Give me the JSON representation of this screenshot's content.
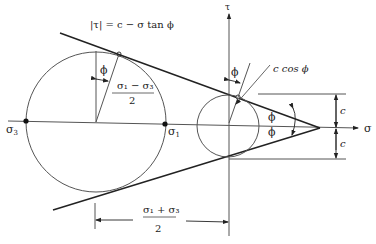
{
  "diagram": {
    "equation": "|τ| = c − σ tan ϕ",
    "axes": {
      "horizontal_label": "σ",
      "vertical_label": "τ"
    },
    "labels": {
      "sigma3": "σ",
      "sigma3_sub": "3",
      "sigma1": "σ",
      "sigma1_sub": "1",
      "phi_top_big": "ϕ",
      "phi_top_small": "ϕ",
      "phi_apex_upper": "ϕ",
      "phi_apex_lower": "ϕ",
      "c_cos_phi": "c cos ϕ",
      "c_upper": "c",
      "c_lower": "c",
      "radius_numerator": "σ₁ − σ₃",
      "radius_denominator": "2",
      "center_numerator": "σ₁ + σ₃",
      "center_denominator": "2"
    },
    "colors": {
      "line": "#222222",
      "background": "#ffffff"
    }
  }
}
